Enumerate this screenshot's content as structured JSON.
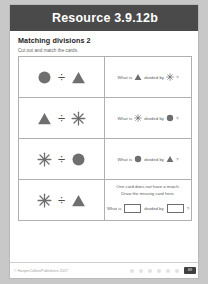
{
  "header": {
    "title": "Resource 3.9.12b"
  },
  "worksheet": {
    "heading": "Matching divisions 2",
    "instruction": "Cut out and match the cards."
  },
  "shapes": {
    "circle": "circle-shape",
    "triangle": "triangle-shape",
    "star": "star-shape"
  },
  "symbols": {
    "divide": "÷",
    "question_mark": "?"
  },
  "cards": [
    {
      "left": {
        "name": "division-card-1",
        "dividend": "circle",
        "operator": "÷",
        "divisor": "triangle"
      },
      "right": {
        "name": "question-card-1",
        "prefix": "What is",
        "dividend": "triangle",
        "middle": "divided by",
        "divisor": "star",
        "suffix": "?"
      }
    },
    {
      "left": {
        "name": "division-card-2",
        "dividend": "triangle",
        "operator": "÷",
        "divisor": "star"
      },
      "right": {
        "name": "question-card-2",
        "prefix": "What is",
        "dividend": "star",
        "middle": "divided by",
        "divisor": "circle",
        "suffix": "?"
      }
    },
    {
      "left": {
        "name": "division-card-3",
        "dividend": "star",
        "operator": "÷",
        "divisor": "circle"
      },
      "right": {
        "name": "question-card-3",
        "prefix": "What is",
        "dividend": "circle",
        "middle": "divided by",
        "divisor": "triangle",
        "suffix": "?"
      }
    },
    {
      "left": {
        "name": "division-card-4",
        "dividend": "star",
        "operator": "÷",
        "divisor": "triangle"
      },
      "right": {
        "name": "missing-card-note",
        "note_line_1": "One card does not have a match.",
        "note_line_2": "Draw the missing card here.",
        "answer_prefix": "What is",
        "answer_middle": "divided by",
        "answer_suffix": "?",
        "answer_box_1_value": "",
        "answer_box_2_value": ""
      }
    }
  ],
  "footer": {
    "copyright": "© HarperCollinsPublishers 2017",
    "page_number": "69",
    "dot_count": 6
  },
  "colors": {
    "banner": "#4a4a4a",
    "shape_fill": "#6f6f6f",
    "text": "#5a5a5a",
    "border": "#b0b0b0"
  }
}
